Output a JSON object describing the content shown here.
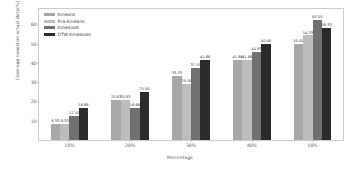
{
  "chart_data": {
    "type": "bar",
    "title": "",
    "xlabel": "Percentage",
    "ylabel": "Coverage based on actual data(%)",
    "categories": [
      "10%",
      "20%",
      "30%",
      "40%",
      "50%"
    ],
    "ylim": [
      0,
      68
    ],
    "yticks": [
      10,
      20,
      30,
      40,
      50,
      60
    ],
    "ytick_labels": [
      "10",
      "20",
      "30",
      "40",
      "50",
      "60"
    ],
    "grid": false,
    "legend_position": "upper left",
    "series": [
      {
        "name": "Kmeans",
        "color": "#a8a8a8",
        "values": [
          8.33,
          20.83,
          33.33,
          41.66,
          50.0
        ],
        "labels": [
          "8.33",
          "20.83",
          "33.33",
          "41.66",
          "50.00"
        ]
      },
      {
        "name": "Pca-Kmeans",
        "color": "#bdbdbd",
        "values": [
          8.33,
          20.83,
          29.16,
          41.66,
          54.33
        ],
        "labels": [
          "8.33",
          "20.83",
          "29.16",
          "41.66",
          "54.33"
        ]
      },
      {
        "name": "Kmedoids",
        "color": "#707070",
        "values": [
          12.5,
          16.66,
          37.5,
          45.83,
          62.5
        ],
        "labels": [
          "12.50",
          "16.66",
          "37.50",
          "45.83",
          "62.50"
        ]
      },
      {
        "name": "DTW-Kmedoids",
        "color": "#2b2b2b",
        "values": [
          16.66,
          25.0,
          41.66,
          50.0,
          58.33
        ],
        "labels": [
          "16.66",
          "25.00",
          "41.66",
          "50.00",
          "58.33"
        ]
      }
    ]
  }
}
